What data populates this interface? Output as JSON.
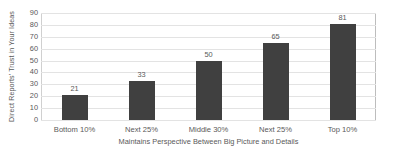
{
  "chart_data": {
    "type": "bar",
    "title": "",
    "subtitle": "",
    "categories": [
      "Bottom 10%",
      "Next 25%",
      "Middle 30%",
      "Next 25%",
      "Top 10%"
    ],
    "values": [
      21,
      33,
      50,
      65,
      81
    ],
    "data_labels": [
      "21",
      "33",
      "50",
      "65",
      "81"
    ],
    "xlabel": "Maintains Perspective Between Big Picture and Details",
    "ylabel": "Direct Reports' Trust in Your Ideas",
    "ylim": [
      0,
      90
    ],
    "ytick_labels": [
      "90",
      "80",
      "70",
      "60",
      "50",
      "40",
      "30",
      "20",
      "10",
      "0"
    ],
    "ytick_values": [
      90,
      80,
      70,
      60,
      50,
      40,
      30,
      20,
      10,
      0
    ],
    "ytick_step": 10,
    "grid": "horizontal",
    "legend": "none",
    "series": [
      {
        "name": "Direct Reports' Trust in Your Ideas",
        "values": [
          21,
          33,
          50,
          65,
          81
        ]
      }
    ],
    "colors": {
      "bar_fill": "#404040",
      "gridline": "#e3e3e3",
      "axis_line": "#d0d0d0",
      "text": "#595959",
      "background": "#ffffff"
    }
  }
}
